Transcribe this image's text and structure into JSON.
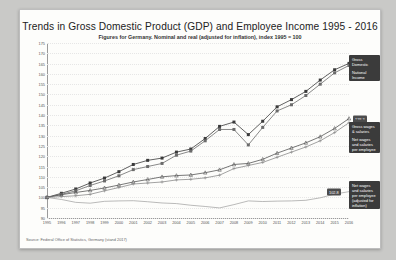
{
  "chart_data": {
    "type": "line",
    "title": "Trends in Gross Domestic Product (GDP) and Employee Income 1995 - 2016",
    "subtitle": "Figures for Germany. Nominal and real (adjusted for inflation), index 1995 = 100",
    "xlabel": "",
    "ylabel": "",
    "ylim": [
      90,
      175
    ],
    "ytick_step": 5,
    "grid": true,
    "legend_position": "right-inline",
    "source": "Source: Federal Office of Statistics, Germany (stand 2017)",
    "categories": [
      "1995",
      "1996",
      "1997",
      "1998",
      "1999",
      "2000",
      "2001",
      "2002",
      "2003",
      "2004",
      "2005",
      "2006",
      "2007",
      "2008",
      "2009",
      "2010",
      "2011",
      "2012",
      "2013",
      "2014",
      "2015",
      "2016"
    ],
    "yticks": [
      175,
      170,
      165,
      160,
      155,
      150,
      145,
      140,
      135,
      130,
      125,
      120,
      115,
      110,
      105,
      100,
      95,
      90
    ],
    "series": [
      {
        "name": "Gross Domestic Product",
        "color": "#3a3a3a",
        "marker": "square",
        "end_value": "165.1",
        "values": [
          100.0,
          102.0,
          104.1,
          107.0,
          109.4,
          112.5,
          116.0,
          118.0,
          119.1,
          122.0,
          123.5,
          128.6,
          134.5,
          136.6,
          130.5,
          137.0,
          144.0,
          147.5,
          151.5,
          157.0,
          162.0,
          165.1
        ]
      },
      {
        "name": "National Income",
        "color": "#6b6b6b",
        "marker": "square",
        "end_value": "164.1",
        "values": [
          100.0,
          101.5,
          103.2,
          105.8,
          108.0,
          110.5,
          113.5,
          115.0,
          116.5,
          120.5,
          122.5,
          127.5,
          133.0,
          133.0,
          125.5,
          134.0,
          142.0,
          145.0,
          149.5,
          155.0,
          160.5,
          164.1
        ]
      },
      {
        "name": "Gross wages & salaries per employee",
        "color": "#555555",
        "marker": "triangle",
        "end_value": "138.3",
        "values": [
          100.0,
          101.3,
          102.4,
          103.4,
          104.6,
          106.0,
          107.5,
          108.7,
          110.0,
          110.6,
          110.9,
          112.0,
          113.4,
          116.0,
          116.5,
          118.5,
          121.5,
          124.0,
          126.5,
          129.5,
          133.5,
          138.3
        ]
      },
      {
        "name": "Net wages and salaries per employee",
        "color": "#8a8a8a",
        "marker": "plus",
        "end_value": "136.3",
        "values": [
          100.0,
          100.4,
          100.8,
          101.5,
          103.2,
          104.8,
          106.5,
          107.0,
          107.5,
          108.5,
          108.8,
          109.5,
          110.8,
          114.0,
          115.5,
          117.0,
          119.5,
          122.0,
          124.5,
          127.5,
          131.5,
          136.3
        ]
      },
      {
        "name": "Net wages and salaries per employee (adjusted for inflation)",
        "color": "#9c9c9c",
        "marker": "none",
        "end_value": "102.8",
        "values": [
          100.0,
          99.0,
          97.6,
          97.2,
          98.1,
          98.3,
          98.4,
          97.9,
          97.3,
          97.0,
          96.2,
          95.6,
          94.9,
          96.5,
          98.3,
          98.0,
          98.2,
          98.3,
          98.6,
          99.8,
          101.6,
          102.8
        ]
      }
    ]
  },
  "labels": {
    "gdp_value": "165.1",
    "national_income_value": "164.1",
    "gross_wages_value": "138.3",
    "net_wages_value": "136.3",
    "net_wages_real_value": "102.8",
    "gdp_legend": "Gross Domestic Product",
    "national_income_legend": "National Income",
    "gross_wages_legend": "Gross wages & salaries\nper employee",
    "net_wages_legend": "Net wages and salaries\nper employee",
    "net_wages_real_legend": "Net wages and salaries\nper employee\n(adjusted for inflation)"
  }
}
